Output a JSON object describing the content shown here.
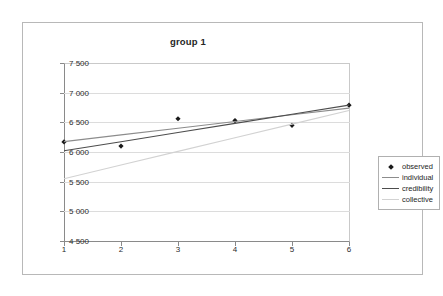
{
  "chart_data": {
    "type": "line",
    "title": "group 1",
    "xlabel": "",
    "ylabel": "",
    "xlim": [
      1,
      6
    ],
    "ylim": [
      4500,
      7500
    ],
    "grid": true,
    "legend_position": "right",
    "x": [
      1,
      2,
      3,
      4,
      5,
      6
    ],
    "xtick_labels": [
      "1",
      "2",
      "3",
      "4",
      "5",
      "6"
    ],
    "ytick_values": [
      4500,
      5000,
      5500,
      6000,
      6500,
      7000,
      7500
    ],
    "ytick_labels": [
      "4 500",
      "5 000",
      "5 500",
      "6 000",
      "6 500",
      "7 000",
      "7 500"
    ],
    "series": [
      {
        "name": "observed",
        "style": "markers",
        "marker": "diamond",
        "color": "#1a1a1a",
        "values": [
          6170,
          6100,
          6560,
          6530,
          6450,
          6790
        ]
      },
      {
        "name": "individual",
        "style": "line",
        "color": "#8c8c8c",
        "values": [
          6175,
          6288,
          6401,
          6514,
          6627,
          6740
        ]
      },
      {
        "name": "credibility",
        "style": "line",
        "color": "#4d4d4d",
        "values": [
          6020,
          6174,
          6328,
          6482,
          6636,
          6790
        ]
      },
      {
        "name": "collective",
        "style": "line",
        "color": "#d2d2d2",
        "values": [
          5550,
          5780,
          6010,
          6240,
          6470,
          6700
        ]
      }
    ]
  },
  "legend": {
    "items": [
      {
        "label": "observed",
        "key": "diamond-marker",
        "color": "#1a1a1a"
      },
      {
        "label": "individual",
        "key": "line-swatch",
        "color": "#8c8c8c"
      },
      {
        "label": "credibility",
        "key": "line-swatch",
        "color": "#4d4d4d"
      },
      {
        "label": "collective",
        "key": "line-swatch",
        "color": "#d2d2d2"
      }
    ]
  }
}
